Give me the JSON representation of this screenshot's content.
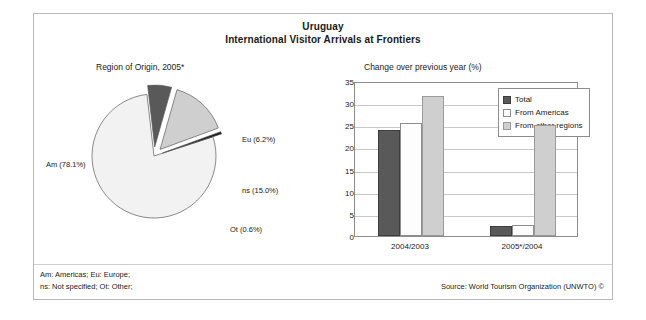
{
  "title": {
    "line1": "Uruguay",
    "line2": "International Visitor Arrivals at Frontiers"
  },
  "pie_subtitle": "Region of Origin, 2005*",
  "bar_subtitle": "Change over previous year (%)",
  "footnotes": {
    "line1": "Am: Americas; Eu: Europe;",
    "line2": "ns: Not specified; Ot: Other;"
  },
  "source": "Source: World Tourism Organization (UNWTO) ©",
  "colors": {
    "total": "#595959",
    "americas": "#fdfdfd",
    "other": "#cfcfcf",
    "pie_am": "#f2f2f2",
    "pie_eu": "#595959",
    "pie_ns": "#cfcfcf",
    "pie_ot": "#1a1a1a",
    "frame": "#b9b9b9",
    "axis": "#8d8d8d",
    "grid": "#c9c9c9"
  },
  "chart_data": [
    {
      "type": "pie",
      "title": "Region of Origin, 2005*",
      "labels": [
        "Am (78.1%)",
        "Eu (6.2%)",
        "ns (15.0%)",
        "Ot (0.6%)"
      ],
      "categories": [
        "Am",
        "Eu",
        "ns",
        "Ot"
      ],
      "values": [
        78.1,
        6.2,
        15.0,
        0.6
      ],
      "unit": "%",
      "exploded": [
        false,
        true,
        true,
        true
      ],
      "legend": "none",
      "slice_colors": [
        "#f2f2f2",
        "#595959",
        "#cfcfcf",
        "#1a1a1a"
      ]
    },
    {
      "type": "bar",
      "title": "Change over previous year (%)",
      "categories": [
        "2004/2003",
        "2005*/2004"
      ],
      "series": [
        {
          "name": "Total",
          "values": [
            24.0,
            2.2
          ]
        },
        {
          "name": "From Americas",
          "values": [
            25.5,
            2.4
          ]
        },
        {
          "name": "From other regions",
          "values": [
            31.7,
            25.0
          ]
        }
      ],
      "xlabel": "",
      "ylabel": "",
      "ylim": [
        0,
        35
      ],
      "yticks": [
        0,
        5,
        10,
        15,
        20,
        25,
        30,
        35
      ],
      "grid": true,
      "legend_position": "top-right"
    }
  ]
}
